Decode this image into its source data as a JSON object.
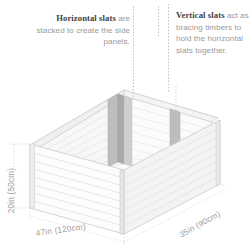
{
  "annotations": {
    "left": {
      "lead": "Horizontal slats",
      "body": " are stacked to create the side panels."
    },
    "right": {
      "lead": "Vertical slats",
      "body": " act as bracing timbers to hold the horizontal slats together."
    }
  },
  "dimensions": {
    "height": "20in (50cm)",
    "width": "47in (120cm)",
    "depth": "35in (90cm)"
  },
  "diagram": {
    "name": "raised-garden-bed-isometric",
    "colors": {
      "outline": "#c9c9c9",
      "slat_face_front": "#fbfbfb",
      "slat_face_side": "#f2f2f2",
      "slat_face_inner": "#f7f7f7",
      "vertical_slat": "#bdbdbd",
      "vertical_slat_shade": "#a9a9a9",
      "dimension_line": "#cfcfcf",
      "text_muted": "#9a9a9a",
      "text_dark": "#3f3f3f"
    },
    "horizontal_slat_count": 8,
    "vertical_slat_count": 3
  }
}
